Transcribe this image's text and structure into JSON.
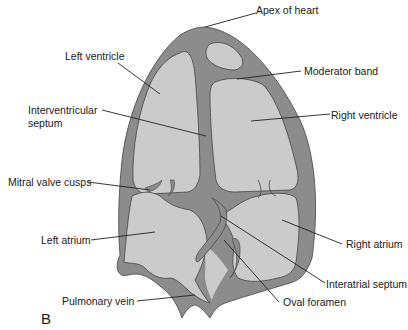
{
  "figure": {
    "panel_label": "B",
    "colors": {
      "background": "#ffffff",
      "wall": "#8c8c8c",
      "chamber": "#cbcbcb",
      "outline": "#444444",
      "leader_line": "#222222",
      "text": "#1a1a1a"
    },
    "labels": {
      "apex": "Apex of heart",
      "left_ventricle": "Left ventricle",
      "moderator_band": "Moderator band",
      "interventricular_septum_1": "Interventricular",
      "interventricular_septum_2": "septum",
      "right_ventricle": "Right ventricle",
      "mitral_valve": "Mitral valve cusps",
      "left_atrium": "Left atrium",
      "right_atrium": "Right atrium",
      "interatrial_septum": "Interatrial septum",
      "pulmonary_vein": "Pulmonary vein",
      "oval_foramen": "Oval foramen"
    }
  }
}
